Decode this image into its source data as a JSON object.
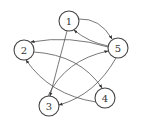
{
  "diagram": {
    "type": "directed-graph",
    "nodes": [
      {
        "id": "1",
        "label": "1",
        "x": 69,
        "y": 21
      },
      {
        "id": "2",
        "label": "2",
        "x": 24,
        "y": 50
      },
      {
        "id": "3",
        "label": "3",
        "x": 49,
        "y": 106
      },
      {
        "id": "4",
        "label": "4",
        "x": 105,
        "y": 98
      },
      {
        "id": "5",
        "label": "5",
        "x": 118,
        "y": 48
      }
    ],
    "edges": [
      {
        "from": "1",
        "to": "5"
      },
      {
        "from": "5",
        "to": "1"
      },
      {
        "from": "5",
        "to": "2"
      },
      {
        "from": "2",
        "to": "4"
      },
      {
        "from": "4",
        "to": "2"
      },
      {
        "from": "1",
        "to": "3"
      },
      {
        "from": "3",
        "to": "5"
      },
      {
        "from": "5",
        "to": "3"
      }
    ]
  },
  "colors": {
    "stroke": "#444444",
    "edge": "#555555",
    "background": "#ffffff"
  }
}
